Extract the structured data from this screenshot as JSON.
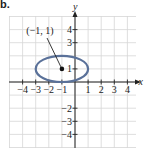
{
  "part_label": "b.",
  "chart_data": {
    "type": "scatter",
    "title": "",
    "xlabel": "x",
    "ylabel": "y",
    "xlim": [
      -4.5,
      4.5
    ],
    "ylim": [
      -4.8,
      4.8
    ],
    "grid": true,
    "x_ticks": [
      -4,
      -3,
      -2,
      -1,
      1,
      2,
      3,
      4
    ],
    "y_ticks": [
      -4,
      -3,
      -2,
      1,
      3,
      4
    ],
    "x_tick_labels": [
      "−4",
      "−3",
      "−2",
      "−1",
      "1",
      "2",
      "3",
      "4"
    ],
    "y_tick_labels": [
      "−4",
      "−3",
      "−2",
      "1",
      "3",
      "4"
    ],
    "shapes": [
      {
        "type": "ellipse",
        "center": [
          -1,
          1
        ],
        "rx": 2,
        "ry": 1,
        "color": "#5a7199"
      }
    ],
    "points": [
      {
        "x": -1,
        "y": 1,
        "label": "(−1, 1)",
        "annotation": "arrow"
      }
    ]
  },
  "colors": {
    "ellipse": "#5a7199",
    "grid": "#d6d6d6",
    "axis": "#222222",
    "text": "#222222"
  }
}
